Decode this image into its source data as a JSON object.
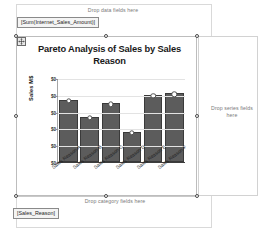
{
  "designer": {
    "drop_zones": {
      "data": "Drop data fields here",
      "category": "Drop category fields here",
      "series": "Drop series fields here"
    },
    "field_tags": {
      "value": "[Sum(Internet_Sales_Amount)]",
      "category": "[Sales_Reason]"
    },
    "icons": {
      "move": "move-handle-icon"
    }
  },
  "colors": {
    "bar_fill": "#5c5c5c",
    "bar_border": "#3a3a3a",
    "marker_fill": "#ffffff",
    "grid": "#e3e3e3",
    "axis": "#3d3d3d",
    "drop_text": "#7a7a7a"
  },
  "chart_data": {
    "type": "bar",
    "title": "Pareto Analysis of Sales by Sales Reason",
    "xlabel": "",
    "ylabel": "Sales M$",
    "categories": [
      "Sales Reason A",
      "Sales Reason B",
      "Sales Reason C",
      "Sales Reason D",
      "Sales Reason E",
      "Sales Reason F"
    ],
    "values": [
      74,
      54,
      70,
      36,
      80,
      82
    ],
    "ylim": [
      0,
      100
    ],
    "yticks": [
      0,
      20,
      40,
      60,
      80,
      100
    ],
    "ytick_labels": [
      "$0",
      "$0",
      "$0",
      "$0",
      "$0",
      "$0"
    ],
    "grid": true,
    "legend": "none",
    "series": [
      {
        "name": "Sum(Internet_Sales_Amount)",
        "values": [
          74,
          54,
          70,
          36,
          80,
          82
        ],
        "markers": true
      }
    ]
  }
}
